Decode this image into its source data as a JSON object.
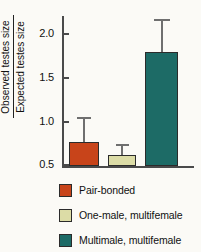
{
  "chart_data": {
    "type": "bar",
    "title": "",
    "xlabel": "",
    "ylabel_numerator": "Observed testes size",
    "ylabel_denominator": "Expected testes size",
    "ylim": [
      0.5,
      2.2
    ],
    "yticks": [
      "0.5",
      "1.0",
      "1.5",
      "2.0"
    ],
    "ytick_values": [
      0.5,
      1.0,
      1.5,
      2.0
    ],
    "grid": false,
    "legend_position": "below",
    "categories": [
      "Pair-bonded",
      "One-male, multifemale",
      "Multimale, multifemale"
    ],
    "values": [
      0.77,
      0.63,
      1.8
    ],
    "errors_upper": [
      1.06,
      0.75,
      2.18
    ],
    "colors": [
      "#c8441a",
      "#dcdca6",
      "#1d6b66"
    ],
    "bars": [
      {
        "label": "Pair-bonded",
        "value": 0.77,
        "error_upper": 1.06,
        "color": "#c8441a"
      },
      {
        "label": "One-male, multifemale",
        "value": 0.63,
        "error_upper": 0.75,
        "color": "#dcdca6"
      },
      {
        "label": "Multimale, multifemale",
        "value": 1.8,
        "error_upper": 2.18,
        "color": "#1d6b66"
      }
    ]
  },
  "legend": {
    "items": [
      {
        "label": "Pair-bonded",
        "color": "#c8441a"
      },
      {
        "label": "One-male, multifemale",
        "color": "#dcdca6"
      },
      {
        "label": "Multimale, multifemale",
        "color": "#1d6b66"
      }
    ]
  },
  "axis": {
    "ticks": [
      {
        "label": "2.0",
        "top": 33
      },
      {
        "label": "1.5",
        "top": 77
      },
      {
        "label": "1.0",
        "top": 121
      },
      {
        "label": "0.5",
        "top": 164
      }
    ]
  }
}
